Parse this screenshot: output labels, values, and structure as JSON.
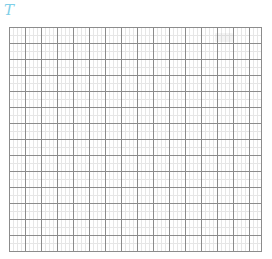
{
  "canvas": {
    "width_px": 272,
    "height_px": 259,
    "background_color": "#ffffff"
  },
  "logo": {
    "text": "T",
    "color": "#7fcfe8",
    "style": "italic"
  },
  "grid": {
    "name": "graph-paper-grid",
    "background_color": "#ffffff",
    "major_line_color": "#8c8c8c",
    "minor_line_color": "#e6e6e6",
    "border_color": "#8c8c8c",
    "columns": 16,
    "rows": 14,
    "major_cell_px": 16,
    "minor_cell_px": 4,
    "left_px": 9,
    "top_px": 27,
    "width_px": 253,
    "height_px": 225
  },
  "marks": {
    "stray_smudge_label": ""
  }
}
